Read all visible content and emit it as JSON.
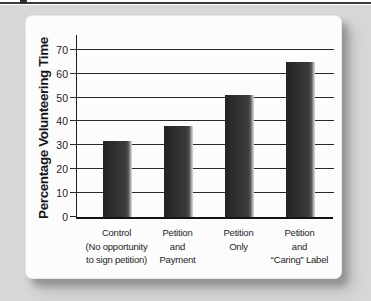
{
  "figure": {
    "top_rule_color": "#3a3a3a",
    "panel_background": "#d7d7d7",
    "card_background": "#fcfcfc"
  },
  "chart_data": {
    "type": "bar",
    "title": "",
    "xlabel": "",
    "ylabel": "Percentage Volunteering Time",
    "categories": [
      [
        "Control",
        "(No opportunity",
        "to sign petition)"
      ],
      [
        "Petition",
        "and",
        "Payment"
      ],
      [
        "Petition",
        "Only"
      ],
      [
        "Petition",
        "and",
        "“Caring” Label"
      ]
    ],
    "values": [
      32,
      38,
      51,
      65
    ],
    "yticks": [
      0,
      10,
      20,
      30,
      40,
      50,
      60,
      70
    ],
    "ylim": [
      0,
      77
    ],
    "grid": true,
    "legend_position": "none",
    "bar_color": "#373737",
    "axis_color": "#1f1f1f"
  }
}
